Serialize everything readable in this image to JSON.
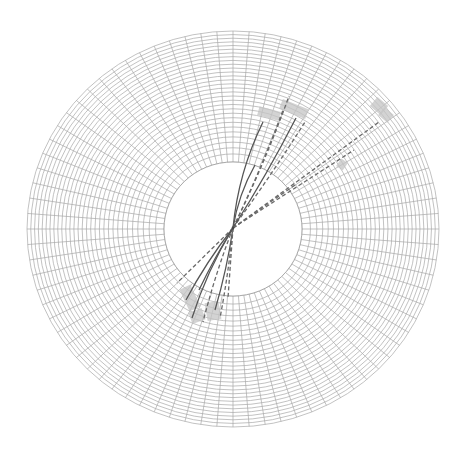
{
  "diagram": {
    "type": "detector-event-display",
    "center": [
      233,
      229
    ],
    "outer_radius_x": 206,
    "outer_radius_y": 198,
    "inner_radius_x": 69,
    "inner_radius_y": 67,
    "ring_count": 30,
    "spoke_count": 80,
    "colors": {
      "grid": "#a8a8a8",
      "hit_cell": "#c4c4c4",
      "track_solid": "#555555",
      "track_dashed": "#6a6a6a",
      "background": "#ffffff"
    },
    "vertex": [
      233,
      228
    ],
    "tracks": [
      {
        "end": [
          289,
          96
        ],
        "style": "dashed",
        "bend": 4
      },
      {
        "end": [
          283,
          110
        ],
        "style": "dashed",
        "bend": 3
      },
      {
        "end": [
          263,
          122
        ],
        "style": "solid",
        "bend": -10
      },
      {
        "end": [
          255,
          165
        ],
        "style": "solid",
        "bend": -6
      },
      {
        "end": [
          305,
          122
        ],
        "style": "dashed",
        "bend": 2
      },
      {
        "end": [
          296,
          118
        ],
        "style": "solid",
        "bend": 3
      },
      {
        "end": [
          379,
          122
        ],
        "style": "dashed",
        "bend": 0
      },
      {
        "end": [
          354,
          150
        ],
        "style": "dashed",
        "bend": 0
      },
      {
        "end": [
          295,
          185
        ],
        "style": "dashed",
        "bend": 0
      },
      {
        "end": [
          177,
          283
        ],
        "style": "dashed",
        "bend": 0
      },
      {
        "end": [
          186,
          300
        ],
        "style": "solid",
        "bend": 4
      },
      {
        "end": [
          192,
          318
        ],
        "style": "solid",
        "bend": 6
      },
      {
        "end": [
          203,
          322
        ],
        "style": "dashed",
        "bend": 3
      },
      {
        "end": [
          215,
          310
        ],
        "style": "solid",
        "bend": -3
      },
      {
        "end": [
          220,
          318
        ],
        "style": "dashed",
        "bend": -2
      },
      {
        "end": [
          228,
          298
        ],
        "style": "dashed",
        "bend": 0
      },
      {
        "end": [
          199,
          290
        ],
        "style": "solid",
        "bend": 2
      }
    ],
    "hit_cells": [
      {
        "x": 258,
        "y": 109,
        "w": 22,
        "h": 9,
        "rot": 15
      },
      {
        "x": 280,
        "y": 104,
        "w": 28,
        "h": 10,
        "rot": 22
      },
      {
        "x": 372,
        "y": 100,
        "w": 14,
        "h": 12,
        "rot": 40
      },
      {
        "x": 380,
        "y": 110,
        "w": 12,
        "h": 10,
        "rot": 40
      },
      {
        "x": 338,
        "y": 160,
        "w": 8,
        "h": 9,
        "rot": 35
      },
      {
        "x": 184,
        "y": 286,
        "w": 12,
        "h": 24,
        "rot": -25
      },
      {
        "x": 190,
        "y": 310,
        "w": 14,
        "h": 12,
        "rot": -20
      },
      {
        "x": 206,
        "y": 302,
        "w": 14,
        "h": 18,
        "rot": -10
      }
    ]
  }
}
